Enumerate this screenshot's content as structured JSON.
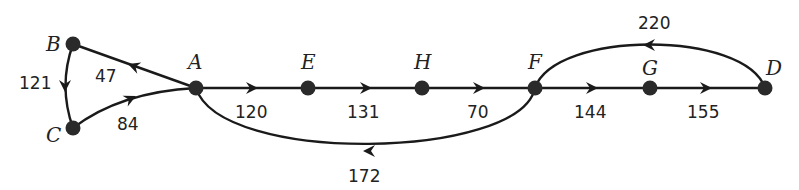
{
  "diagram": {
    "type": "directed-weighted-graph",
    "nodes": [
      {
        "id": "A",
        "label": "A",
        "x": 196,
        "y": 88
      },
      {
        "id": "B",
        "label": "B",
        "x": 73,
        "y": 44
      },
      {
        "id": "C",
        "label": "C",
        "x": 73,
        "y": 128
      },
      {
        "id": "D",
        "label": "D",
        "x": 765,
        "y": 88
      },
      {
        "id": "E",
        "label": "E",
        "x": 308,
        "y": 88
      },
      {
        "id": "F",
        "label": "F",
        "x": 535,
        "y": 88
      },
      {
        "id": "G",
        "label": "G",
        "x": 650,
        "y": 88
      },
      {
        "id": "H",
        "label": "H",
        "x": 422,
        "y": 88
      }
    ],
    "edges": [
      {
        "from": "A",
        "to": "B",
        "weight": "47"
      },
      {
        "from": "B",
        "to": "C",
        "weight": "121"
      },
      {
        "from": "C",
        "to": "A",
        "weight": "84"
      },
      {
        "from": "A",
        "to": "E",
        "weight": "120"
      },
      {
        "from": "E",
        "to": "H",
        "weight": "131"
      },
      {
        "from": "H",
        "to": "F",
        "weight": "70"
      },
      {
        "from": "F",
        "to": "A",
        "weight": "172"
      },
      {
        "from": "F",
        "to": "G",
        "weight": "144"
      },
      {
        "from": "G",
        "to": "D",
        "weight": "155"
      },
      {
        "from": "D",
        "to": "F",
        "weight": "220"
      }
    ]
  }
}
